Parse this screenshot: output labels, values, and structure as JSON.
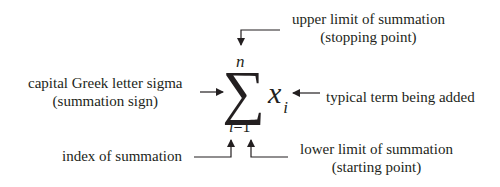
{
  "diagram": {
    "labels": {
      "upper_limit": [
        "upper limit of summation",
        "(stopping point)"
      ],
      "sigma": [
        "capital Greek letter sigma",
        "(summation sign)"
      ],
      "term": [
        "typical term being added"
      ],
      "index": [
        "index of summation"
      ],
      "lower_limit": [
        "lower limit of summation",
        "(starting point)"
      ]
    },
    "notation": {
      "sigma_symbol": "∑",
      "upper": "n",
      "index_var": "i",
      "equals": "=",
      "lower_value": "1",
      "term_var": "x",
      "term_subscript": "i"
    },
    "colors": {
      "ink": "#231f20",
      "background": "#ffffff"
    }
  }
}
